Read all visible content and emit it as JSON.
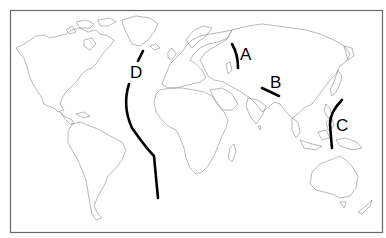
{
  "map": {
    "type": "world outline map (Pacific-centered Eurasia view, Atlantic left of center)",
    "labels": [
      {
        "id": "A",
        "text": "A"
      },
      {
        "id": "B",
        "text": "B"
      },
      {
        "id": "C",
        "text": "C"
      },
      {
        "id": "D",
        "text": "D"
      }
    ],
    "line_color": "#000000",
    "coast_color": "#8a8a8a",
    "frame_color": "#6a6a6a"
  }
}
